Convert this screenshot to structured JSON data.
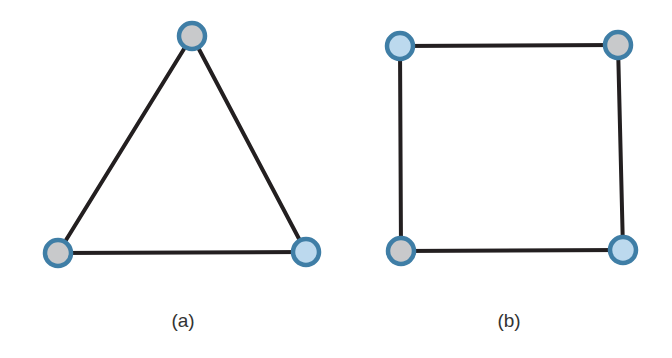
{
  "figures": [
    {
      "id": "a",
      "caption": "(a)",
      "caption_pos": [
        183,
        310
      ],
      "shape": "triangle",
      "nodes": [
        {
          "name": "top",
          "x": 192,
          "y": 36,
          "fill": "gray"
        },
        {
          "name": "bottom-left",
          "x": 58,
          "y": 253,
          "fill": "gray"
        },
        {
          "name": "bottom-right",
          "x": 306,
          "y": 252,
          "fill": "blue"
        }
      ],
      "edges": [
        [
          0,
          1
        ],
        [
          0,
          2
        ],
        [
          1,
          2
        ]
      ]
    },
    {
      "id": "b",
      "caption": "(b)",
      "caption_pos": [
        509,
        310
      ],
      "shape": "square",
      "nodes": [
        {
          "name": "top-left",
          "x": 400,
          "y": 46,
          "fill": "blue"
        },
        {
          "name": "top-right",
          "x": 618,
          "y": 45,
          "fill": "gray"
        },
        {
          "name": "bottom-left",
          "x": 401,
          "y": 251,
          "fill": "gray"
        },
        {
          "name": "bottom-right",
          "x": 623,
          "y": 250,
          "fill": "blue"
        }
      ],
      "edges": [
        [
          0,
          1
        ],
        [
          1,
          3
        ],
        [
          3,
          2
        ],
        [
          2,
          0
        ]
      ]
    }
  ],
  "colors": {
    "edge": "#231f20",
    "node_stroke": "#3f7ea6",
    "node_fill_gray": "#c8c9cb",
    "node_fill_blue": "#bcd9ee"
  }
}
